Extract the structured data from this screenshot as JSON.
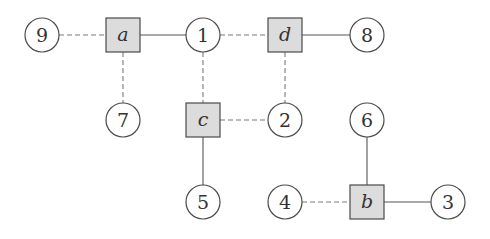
{
  "diagram": {
    "type": "factor-graph",
    "colors": {
      "stroke": "#4a4a4a",
      "square_fill": "#dcdcdc",
      "circle_fill": "#ffffff",
      "text": "#333333",
      "dashed_edge": "#7a7a7a",
      "solid_edge": "#555555"
    },
    "variable_nodes": [
      {
        "id": "n9",
        "label": "9",
        "x": 42,
        "y": 35
      },
      {
        "id": "n1",
        "label": "1",
        "x": 203,
        "y": 35
      },
      {
        "id": "n8",
        "label": "8",
        "x": 367,
        "y": 35
      },
      {
        "id": "n7",
        "label": "7",
        "x": 123,
        "y": 120
      },
      {
        "id": "n2",
        "label": "2",
        "x": 285,
        "y": 120
      },
      {
        "id": "n6",
        "label": "6",
        "x": 367,
        "y": 120
      },
      {
        "id": "n5",
        "label": "5",
        "x": 203,
        "y": 202
      },
      {
        "id": "n4",
        "label": "4",
        "x": 285,
        "y": 202
      },
      {
        "id": "n3",
        "label": "3",
        "x": 448,
        "y": 202
      }
    ],
    "factor_nodes": [
      {
        "id": "fa",
        "label": "a",
        "x": 123,
        "y": 35
      },
      {
        "id": "fd",
        "label": "d",
        "x": 285,
        "y": 35
      },
      {
        "id": "fc",
        "label": "c",
        "x": 203,
        "y": 120
      },
      {
        "id": "fb",
        "label": "b",
        "x": 367,
        "y": 202
      }
    ],
    "edges": [
      {
        "from": "n9",
        "to": "fa",
        "style": "dashed"
      },
      {
        "from": "fa",
        "to": "n1",
        "style": "solid"
      },
      {
        "from": "n1",
        "to": "fd",
        "style": "dashed"
      },
      {
        "from": "fd",
        "to": "n8",
        "style": "solid"
      },
      {
        "from": "fa",
        "to": "n7",
        "style": "dashed"
      },
      {
        "from": "n1",
        "to": "fc",
        "style": "dashed"
      },
      {
        "from": "fd",
        "to": "n2",
        "style": "dashed"
      },
      {
        "from": "fc",
        "to": "n2",
        "style": "dashed"
      },
      {
        "from": "fc",
        "to": "n5",
        "style": "solid"
      },
      {
        "from": "n6",
        "to": "fb",
        "style": "solid"
      },
      {
        "from": "n4",
        "to": "fb",
        "style": "dashed"
      },
      {
        "from": "fb",
        "to": "n3",
        "style": "solid"
      }
    ]
  }
}
